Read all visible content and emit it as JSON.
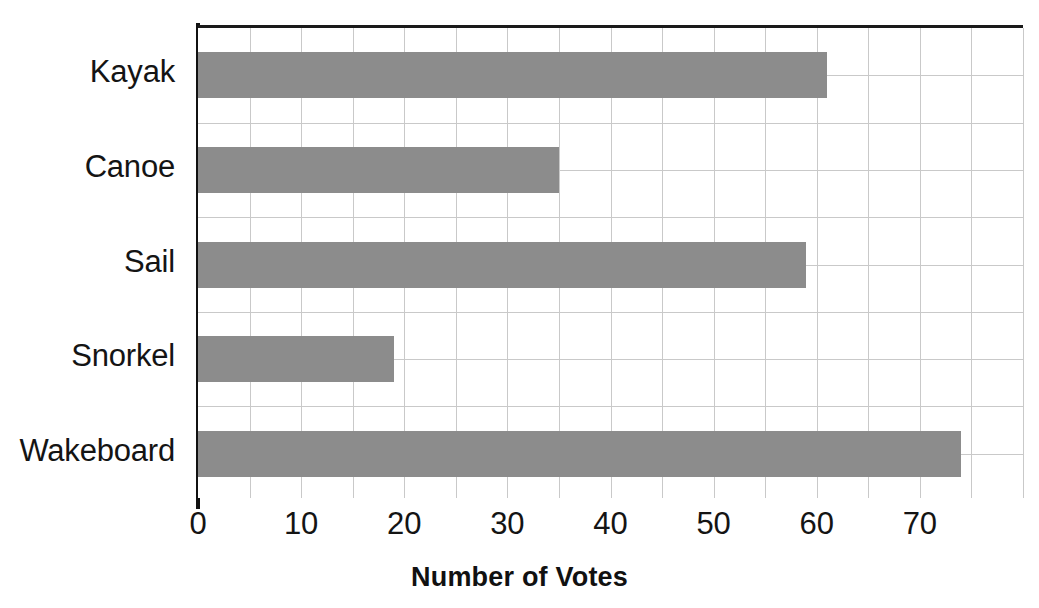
{
  "chart_data": {
    "type": "bar",
    "orientation": "horizontal",
    "title": "",
    "xlabel": "Number of Votes",
    "ylabel": "",
    "categories": [
      "Kayak",
      "Canoe",
      "Sail",
      "Snorkel",
      "Wakeboard"
    ],
    "values": [
      61,
      35,
      59,
      19,
      74
    ],
    "xlim": [
      0,
      80
    ],
    "xticks": [
      0,
      10,
      20,
      30,
      40,
      50,
      60,
      70
    ],
    "xtick_labels": [
      "0",
      "10",
      "20",
      "30",
      "40",
      "50",
      "60",
      "70"
    ],
    "minor_gridline_step": 5,
    "grid": true,
    "legend": false,
    "bar_color": "#8c8c8c",
    "axis_color": "#111111",
    "gridline_color": "#c9c9c9",
    "background": "#ffffff"
  },
  "axis": {
    "x_title": "Number of Votes"
  }
}
